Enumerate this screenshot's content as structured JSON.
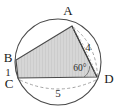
{
  "figure": {
    "vertices": [
      {
        "name": "A",
        "label": "A",
        "x": 72,
        "y": 26
      },
      {
        "name": "B",
        "label": "B",
        "x": 16,
        "y": 60
      },
      {
        "name": "C",
        "label": "C",
        "x": 18,
        "y": 78
      },
      {
        "name": "D",
        "label": "D",
        "x": 97,
        "y": 77
      }
    ],
    "labels": {
      "vertex_a": "A",
      "vertex_b": "B",
      "vertex_c": "C",
      "vertex_d": "D"
    },
    "measurements": {
      "side_bc": "1",
      "side_cd": "5",
      "side_ad": "4",
      "angle_d": "60°"
    },
    "colors": {
      "fill": "#d4d4d4",
      "stroke": "#3a3a3a",
      "circle_stroke": "#4a4a4a",
      "dashed_stroke": "#8c8c8c",
      "text": "#1a1a1a",
      "background": "#ffffff"
    },
    "circle": {
      "center_x": 58,
      "center_y": 62,
      "radius": 43
    }
  }
}
